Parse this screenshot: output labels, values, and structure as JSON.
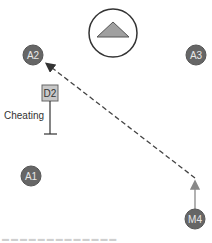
{
  "diagram": {
    "colors": {
      "agent_fill": "#666666",
      "agent_stroke": "#555555",
      "label_light": "#e8e8e8",
      "box_fill": "#c8c8c8",
      "box_stroke": "#666666",
      "edge": "#444444",
      "solid_arrow": "#888888",
      "goal_triangle": "#a0a0a0"
    },
    "goal": {
      "icon": "triangle-icon"
    },
    "nodes": {
      "a1": {
        "label": "A1"
      },
      "a2": {
        "label": "A2"
      },
      "a3": {
        "label": "A3"
      },
      "m": {
        "label": "M4"
      },
      "d2": {
        "label": "D2"
      }
    },
    "annotation": {
      "cheating_label": "Cheating"
    },
    "footer": {
      "text": "▬ ▬ ▬ ▬ ▬ ▬   ▬ ▬ ▬ ▬ ▬   ▬ ▬"
    }
  }
}
